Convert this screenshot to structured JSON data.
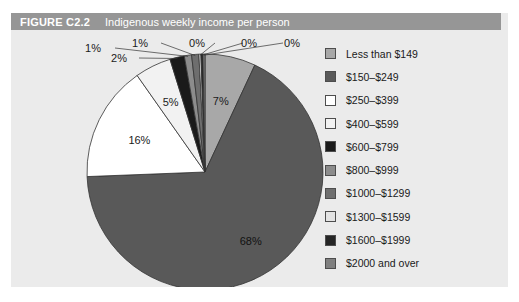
{
  "figure": {
    "number": "FIGURE C2.2",
    "title": "Indigenous weekly income per person",
    "title_bar_color": "#969696",
    "background_color": "#ebebeb",
    "title_text_color": "#ffffff"
  },
  "chart_data": {
    "type": "pie",
    "title": "Indigenous weekly income per person",
    "xlabel": "",
    "ylabel": "",
    "legend_position": "right",
    "grid": false,
    "categories": [
      "Less than $149",
      "$150–$249",
      "$250–$399",
      "$400–$599",
      "$600–$799",
      "$800–$999",
      "$1000–$1299",
      "$1300–$1599",
      "$1600–$1999",
      "$2000 and over"
    ],
    "values": [
      7,
      68,
      16,
      5,
      2,
      1,
      1,
      0,
      0,
      0
    ],
    "data_labels": [
      "7%",
      "68%",
      "16%",
      "5%",
      "2%",
      "1%",
      "1%",
      "0%",
      "0%",
      "0%"
    ],
    "colors": [
      "#a8a8a8",
      "#595959",
      "#ffffff",
      "#f2f2f2",
      "#1a1a1a",
      "#8c8c8c",
      "#6e6e6e",
      "#e3e3e3",
      "#262626",
      "#808080"
    ],
    "slice_outline_color": "#333333",
    "start_angle_deg": 0,
    "direction": "clockwise"
  },
  "legend": {
    "items": [
      {
        "label": "Less than $149",
        "color": "#a8a8a8"
      },
      {
        "label": "$150–$249",
        "color": "#595959"
      },
      {
        "label": "$250–$399",
        "color": "#ffffff"
      },
      {
        "label": "$400–$599",
        "color": "#f2f2f2"
      },
      {
        "label": "$600–$799",
        "color": "#1a1a1a"
      },
      {
        "label": "$800–$999",
        "color": "#8c8c8c"
      },
      {
        "label": "$1000–$1299",
        "color": "#6e6e6e"
      },
      {
        "label": "$1300–$1599",
        "color": "#e3e3e3"
      },
      {
        "label": "$1600–$1999",
        "color": "#262626"
      },
      {
        "label": "$2000 and over",
        "color": "#808080"
      }
    ]
  }
}
